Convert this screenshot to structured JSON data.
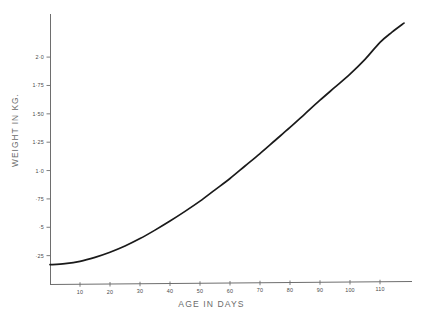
{
  "chart_data": {
    "type": "line",
    "title": "",
    "subtitle": "",
    "xlabel": "AGE IN DAYS",
    "ylabel": "WEIGHT IN KG.",
    "xlim": [
      0,
      120
    ],
    "ylim": [
      0,
      2.38
    ],
    "grid": false,
    "legend": null,
    "xticks": [
      10,
      20,
      30,
      40,
      50,
      60,
      70,
      80,
      90,
      100,
      110
    ],
    "xtick_labels": [
      "10",
      "20",
      "30",
      "40",
      "50",
      "60",
      "70",
      "80",
      "90",
      "100",
      "110"
    ],
    "yticks": [
      0.25,
      0.5,
      0.75,
      1.0,
      1.25,
      1.5,
      1.75,
      2.0
    ],
    "ytick_labels": [
      "·25",
      "·5",
      "·75",
      "1·0",
      "1·25",
      "1·50",
      "1·75",
      "2·0"
    ],
    "series": [
      {
        "name": "growth curve",
        "color": "#1a1a1a",
        "x": [
          0,
          5,
          10,
          15,
          20,
          25,
          30,
          35,
          40,
          45,
          50,
          55,
          60,
          65,
          70,
          75,
          80,
          85,
          90,
          95,
          100,
          105,
          110,
          114,
          118
        ],
        "y": [
          0.17,
          0.18,
          0.2,
          0.235,
          0.28,
          0.335,
          0.4,
          0.475,
          0.555,
          0.64,
          0.73,
          0.83,
          0.93,
          1.04,
          1.15,
          1.265,
          1.38,
          1.5,
          1.62,
          1.735,
          1.85,
          1.98,
          2.13,
          2.22,
          2.3
        ]
      }
    ]
  },
  "axes": {
    "x_axis_label": "AGE IN DAYS",
    "y_axis_label": "WEIGHT IN KG."
  }
}
